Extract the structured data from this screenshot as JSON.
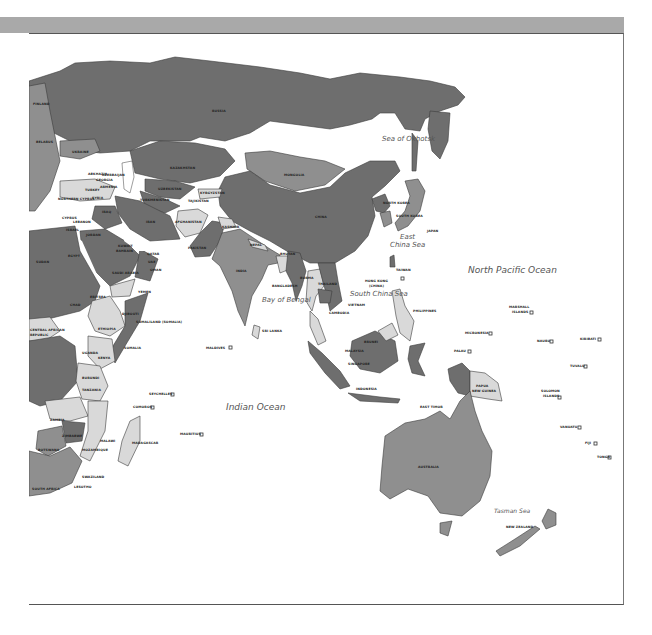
{
  "map": {
    "title": "",
    "colors": {
      "dark_region": "#6e6e6e",
      "medium_region": "#8f8f8f",
      "light_region": "#d9d9d9",
      "water": "#ffffff",
      "header_bar": "#a9a9a9"
    },
    "seas": {
      "okhotsk": "Sea of Okhotsk",
      "east_china": "East",
      "east_china2": "China Sea",
      "north_pacific": "North Pacific Ocean",
      "south_china": "South China Sea",
      "bengal": "Bay of Bengal",
      "indian": "Indian Ocean",
      "tasman": "Tasman Sea"
    },
    "countries": {
      "russia": "RUSSIA",
      "kazakhstan": "KAZAKHSTAN",
      "mongolia": "MONGOLIA",
      "china": "CHINA",
      "north_korea": "NORTH KOREA",
      "south_korea": "SOUTH KOREA",
      "japan": "JAPAN",
      "taiwan": "TAIWAN",
      "hong_kong": "HONG KONG",
      "hong_kong_sub": "(CHINA)",
      "afghanistan": "AFGHANISTAN",
      "pakistan": "PAKISTAN",
      "india": "INDIA",
      "nepal": "NEPAL",
      "bhutan": "BHUTAN",
      "bangladesh": "BANGLADESH",
      "burma": "BURMA",
      "thailand": "THAILAND",
      "cambodia": "CAMBODIA",
      "vietnam": "VIETNAM",
      "philippines": "PHILIPPINES",
      "malaysia": "MALAYSIA",
      "brunei": "BRUNEI",
      "singapore": "SINGAPORE",
      "indonesia": "INDONESIA",
      "east_timor": "EAST TIMOR",
      "papua": "PAPUA",
      "new_guinea": "NEW GUINEA",
      "sri_lanka": "SRI LANKA",
      "maldives": "MALDIVES",
      "australia": "AUSTRALIA",
      "new_zealand": "NEW ZEALAND",
      "iran": "IRAN",
      "iraq": "IRAQ",
      "syria": "SYRIA",
      "turkey": "TURKEY",
      "cyprus": "CYPRUS",
      "northern_cyprus": "NORTHERN CYPRUS",
      "lebanon": "LEBANON",
      "israel": "ISRAEL",
      "jordan": "JORDAN",
      "saudi_arabia": "SAUDI ARABIA",
      "kuwait": "KUWAIT",
      "bahrain": "BAHRAIN",
      "qatar": "QATAR",
      "uae": "UAE",
      "oman": "OMAN",
      "yemen": "YEMEN",
      "egypt": "EGYPT",
      "sudan": "SUDAN",
      "chad": "CHAD",
      "eritrea": "ERITREA",
      "djibouti": "DJIBOUTI",
      "ethiopia": "ETHIOPIA",
      "somaliland": "SOMALILAND (SOMALIA)",
      "somalia": "SOMALIA",
      "kenya": "KENYA",
      "uganda": "UGANDA",
      "rwanda": "RWANDA",
      "burundi": "BURUNDI",
      "tanzania": "TANZANIA",
      "zambia": "ZAMBIA",
      "malawi": "MALAWI",
      "mozambique": "MOZAMBIQUE",
      "zimbabwe": "ZIMBABWE",
      "botswana": "BOTSWANA",
      "south_africa": "SOUTH AFRICA",
      "swaziland": "SWAZILAND",
      "lesotho": "LESOTHO",
      "madagascar": "MADAGASCAR",
      "comoros": "COMOROS",
      "seychelles": "SEYCHELLES",
      "mauritius": "MAURITIUS",
      "car": "CENTRAL AFRICAN",
      "car2": "REPUBLIC",
      "ukraine": "UKRAINE",
      "belarus": "BELARUS",
      "finland": "FINLAND",
      "georgia": "GEORGIA",
      "armenia": "ARMENIA",
      "azerbaijan": "AZERBAIJAN",
      "abkhazia": "ABKHAZIA",
      "uzbekistan": "UZBEKISTAN",
      "turkmenistan": "TURKMENISTAN",
      "kyrgyzstan": "KYRGYZSTAN",
      "tajikistan": "TAJIKISTAN",
      "kashmir": "KASHMIR",
      "micronesia": "MICRONESIA",
      "marshall": "MARSHALL",
      "marshall2": "ISLANDS",
      "palau": "PALAU",
      "nauru": "NAURU",
      "kiribati": "KIRIBATI",
      "tuvalu": "TUVALU",
      "solomon": "SOLOMON",
      "solomon2": "ISLANDS",
      "vanuatu": "VANUATU",
      "fiji": "FIJI",
      "tonga": "TONGA",
      "turkish_rep": "TURKISH REP. N. CYPRUS"
    }
  }
}
